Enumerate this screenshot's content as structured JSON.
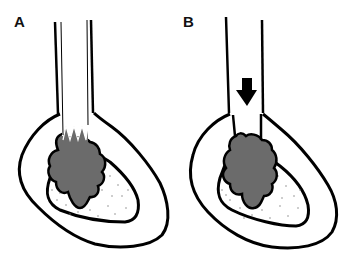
{
  "panels": [
    {
      "label": "A",
      "description": "tube with serrated cutting edge inserted into bone cavity with lesion"
    },
    {
      "label": "B",
      "description": "open tube with downward arrow pushed into bone cavity with lesion"
    }
  ],
  "colors": {
    "outline": "#000000",
    "lesion": "#6b6b6b",
    "background": "#ffffff",
    "stipple": "#777777"
  }
}
